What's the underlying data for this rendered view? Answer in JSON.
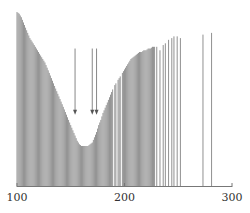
{
  "chart_data": {
    "type": "bar",
    "title": "",
    "xlabel": "",
    "ylabel": "",
    "xlim": [
      100,
      300
    ],
    "ylim": [
      0,
      100
    ],
    "grid": false,
    "legend": null,
    "xticks": [
      100,
      200,
      300
    ],
    "xtick_labels": [
      "100",
      "200",
      "300"
    ],
    "bar_color": "#8a8a8a",
    "profile": [
      {
        "x": 100,
        "y": 100
      },
      {
        "x": 102,
        "y": 99
      },
      {
        "x": 104,
        "y": 97
      },
      {
        "x": 106,
        "y": 94
      },
      {
        "x": 108,
        "y": 91
      },
      {
        "x": 110,
        "y": 88
      },
      {
        "x": 112,
        "y": 85
      },
      {
        "x": 114,
        "y": 83
      },
      {
        "x": 116,
        "y": 81
      },
      {
        "x": 118,
        "y": 79
      },
      {
        "x": 120,
        "y": 77
      },
      {
        "x": 122,
        "y": 75
      },
      {
        "x": 124,
        "y": 73
      },
      {
        "x": 126,
        "y": 71
      },
      {
        "x": 128,
        "y": 68
      },
      {
        "x": 130,
        "y": 65
      },
      {
        "x": 132,
        "y": 62
      },
      {
        "x": 134,
        "y": 59
      },
      {
        "x": 136,
        "y": 56
      },
      {
        "x": 138,
        "y": 53
      },
      {
        "x": 140,
        "y": 50
      },
      {
        "x": 142,
        "y": 47
      },
      {
        "x": 144,
        "y": 44
      },
      {
        "x": 146,
        "y": 41
      },
      {
        "x": 148,
        "y": 38
      },
      {
        "x": 150,
        "y": 35
      },
      {
        "x": 152,
        "y": 32
      },
      {
        "x": 154,
        "y": 29
      },
      {
        "x": 156,
        "y": 26
      },
      {
        "x": 158,
        "y": 24
      },
      {
        "x": 160,
        "y": 23
      },
      {
        "x": 162,
        "y": 23
      },
      {
        "x": 164,
        "y": 23
      },
      {
        "x": 166,
        "y": 23
      },
      {
        "x": 168,
        "y": 24
      },
      {
        "x": 170,
        "y": 25
      },
      {
        "x": 172,
        "y": 28
      },
      {
        "x": 174,
        "y": 31
      },
      {
        "x": 176,
        "y": 35
      },
      {
        "x": 178,
        "y": 38
      },
      {
        "x": 180,
        "y": 42
      },
      {
        "x": 182,
        "y": 45
      },
      {
        "x": 184,
        "y": 48
      },
      {
        "x": 186,
        "y": 51
      },
      {
        "x": 188,
        "y": 54
      },
      {
        "x": 190,
        "y": 57
      },
      {
        "x": 192,
        "y": 59
      },
      {
        "x": 194,
        "y": 61
      },
      {
        "x": 196,
        "y": 63
      },
      {
        "x": 198,
        "y": 65
      },
      {
        "x": 200,
        "y": 67
      },
      {
        "x": 202,
        "y": 69
      },
      {
        "x": 204,
        "y": 71
      },
      {
        "x": 206,
        "y": 73
      },
      {
        "x": 208,
        "y": 74
      },
      {
        "x": 210,
        "y": 75
      },
      {
        "x": 212,
        "y": 76
      },
      {
        "x": 214,
        "y": 77
      },
      {
        "x": 216,
        "y": 77
      },
      {
        "x": 218,
        "y": 78
      },
      {
        "x": 220,
        "y": 78
      },
      {
        "x": 222,
        "y": 79
      },
      {
        "x": 224,
        "y": 79
      },
      {
        "x": 226,
        "y": 80
      },
      {
        "x": 228,
        "y": 80
      }
    ],
    "sparse_lines": [
      {
        "x": 230,
        "y": 80
      },
      {
        "x": 233,
        "y": 78
      },
      {
        "x": 236,
        "y": 81
      },
      {
        "x": 238,
        "y": 82
      },
      {
        "x": 241,
        "y": 84
      },
      {
        "x": 244,
        "y": 85
      },
      {
        "x": 246,
        "y": 86
      },
      {
        "x": 249,
        "y": 86
      },
      {
        "x": 252,
        "y": 85
      },
      {
        "x": 273,
        "y": 87
      },
      {
        "x": 281,
        "y": 88
      }
    ],
    "gaps": [
      190,
      193,
      197
    ],
    "annotations": [
      {
        "type": "arrow",
        "x": 154,
        "y_from": 79,
        "y_to": 41,
        "direction": "down"
      },
      {
        "type": "arrow",
        "x": 170,
        "y_from": 79,
        "y_to": 41,
        "direction": "down"
      },
      {
        "type": "arrow",
        "x": 174,
        "y_from": 79,
        "y_to": 41,
        "direction": "down"
      }
    ]
  }
}
